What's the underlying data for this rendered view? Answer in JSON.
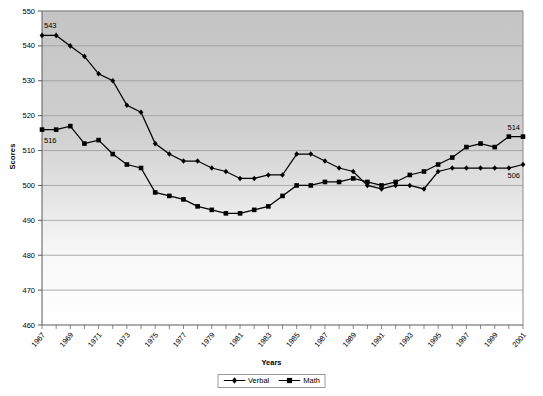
{
  "chart_data": {
    "type": "line",
    "title": "",
    "xlabel": "Years",
    "ylabel": "Scores",
    "ylim": [
      460,
      550
    ],
    "ytick_step": 10,
    "yticks": [
      460,
      470,
      480,
      490,
      500,
      510,
      520,
      530,
      540,
      550
    ],
    "grid": true,
    "legend_position": "bottom-center",
    "x": [
      1967,
      1968,
      1969,
      1970,
      1971,
      1972,
      1973,
      1974,
      1975,
      1976,
      1977,
      1978,
      1979,
      1980,
      1981,
      1982,
      1983,
      1984,
      1985,
      1986,
      1987,
      1988,
      1989,
      1990,
      1991,
      1992,
      1993,
      1994,
      1995,
      1996,
      1997,
      1998,
      1999,
      2000,
      2001
    ],
    "xtick_labels": [
      "1967",
      "1969",
      "1971",
      "1973",
      "1975",
      "1977",
      "1979",
      "1981",
      "1983",
      "1985",
      "1987",
      "1989",
      "1991",
      "1993",
      "1995",
      "1997",
      "1999",
      "2001"
    ],
    "series": [
      {
        "name": "Verbal",
        "marker": "diamond",
        "color": "#000000",
        "values": [
          543,
          543,
          540,
          537,
          532,
          530,
          523,
          521,
          512,
          509,
          507,
          507,
          505,
          504,
          502,
          502,
          503,
          503,
          509,
          509,
          507,
          505,
          504,
          500,
          499,
          500,
          500,
          499,
          504,
          505,
          505,
          505,
          505,
          505,
          506
        ]
      },
      {
        "name": "Math",
        "marker": "square",
        "color": "#000000",
        "values": [
          516,
          516,
          517,
          512,
          513,
          509,
          506,
          505,
          498,
          497,
          496,
          494,
          493,
          492,
          492,
          493,
          494,
          497,
          500,
          500,
          501,
          501,
          502,
          501,
          500,
          501,
          503,
          504,
          506,
          508,
          511,
          512,
          511,
          514,
          514
        ]
      }
    ],
    "annotations": [
      {
        "label": "543",
        "series": "Verbal",
        "x": 1967,
        "value": 543,
        "placement": "above-right"
      },
      {
        "label": "516",
        "series": "Math",
        "x": 1967,
        "value": 516,
        "placement": "below-right"
      },
      {
        "label": "514",
        "series": "Math",
        "x": 2001,
        "value": 514,
        "placement": "above-left"
      },
      {
        "label": "506",
        "series": "Verbal",
        "x": 2001,
        "value": 506,
        "placement": "below-left"
      }
    ],
    "plot_background": {
      "top_color": "#c6c6c6",
      "bottom_color": "#ffffff",
      "description": "vertical gradient light gray fading to white"
    },
    "axis_color": "#555555",
    "gridline_color": "#9a9a9a"
  },
  "legend": {
    "items": [
      {
        "label": "Verbal",
        "marker": "diamond"
      },
      {
        "label": "Math",
        "marker": "square"
      }
    ]
  },
  "axis_titles": {
    "y": "Scores",
    "x": "Years"
  },
  "ticks": {
    "y": [
      "550",
      "540",
      "530",
      "520",
      "510",
      "500",
      "490",
      "480",
      "470",
      "460"
    ],
    "x": [
      "1967",
      "1969",
      "1971",
      "1973",
      "1975",
      "1977",
      "1979",
      "1981",
      "1983",
      "1985",
      "1987",
      "1989",
      "1991",
      "1993",
      "1995",
      "1997",
      "1999",
      "2001"
    ]
  }
}
